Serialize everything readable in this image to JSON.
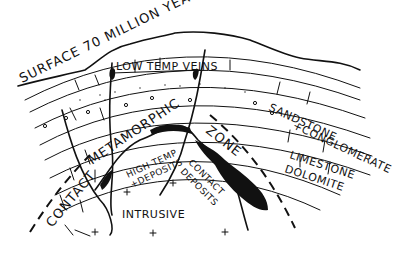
{
  "diagram": {
    "type": "geologic cross-section (hand-drawn)",
    "labels": {
      "surface": "SURFACE 70 MILLION YEARS AGO",
      "low_temp_veins": "LOW TEMP VEINS",
      "sandstone": "SANDSTONE",
      "conglomerate": "+CONGLOMERATE",
      "limestone": "LIMESTONE",
      "dolomite": "DOLOMITE",
      "contact": "CONTACT",
      "metamorphic": "METAMORPHIC",
      "zone": "ZONE",
      "high_temp_1": "HIGH TEMP",
      "high_temp_2": "+DEPOSITS",
      "contact_deposits_1": "CONTACT",
      "contact_deposits_2": "DEPOSITS",
      "intrusive": "INTRUSIVE"
    },
    "layers": [
      "Surface",
      "Sandstone + Conglomerate",
      "Limestone",
      "Dolomite",
      "Intrusive"
    ],
    "colors": {
      "ink": "#111111",
      "background": "#ffffff"
    }
  }
}
